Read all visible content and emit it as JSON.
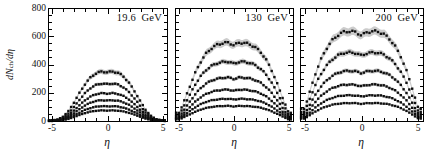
{
  "figure": {
    "xlabel": "η",
    "ylabel_parts": {
      "d1": "d",
      "N": "N",
      "sub": "ch",
      "d2": "/d",
      "eta": "η"
    }
  },
  "chart_data": {
    "type": "scatter",
    "xlabel": "η",
    "ylabel": "dN_ch/dη",
    "xlim": [
      -5.4,
      5.4
    ],
    "ylim": [
      0,
      800
    ],
    "xticks": [
      -5,
      0,
      5
    ],
    "x_minor_step": 1,
    "yticks": [
      0,
      200,
      400,
      600,
      800
    ],
    "y_minor_step": 50,
    "grid": false,
    "legend": "none",
    "marker": "filled-square",
    "marker_color": "#0f0f0f",
    "band_color": "#cccccc",
    "abs_eta": [
      0,
      0.5,
      1,
      1.5,
      2,
      2.5,
      3,
      3.5,
      4,
      4.5,
      5
    ],
    "panels": [
      {
        "title": "19.6  GeV",
        "series": [
          {
            "values": [
              345,
              350,
              340,
              312,
              266,
              205,
              137,
              74,
              32,
              11,
              4
            ]
          },
          {
            "values": [
              261,
              265,
              257,
              236,
              201,
              155,
              103,
              56,
              24,
              8,
              3
            ]
          },
          {
            "values": [
              194,
              197,
              191,
              175,
              150,
              115,
              77,
              41,
              18,
              6,
              2
            ]
          },
          {
            "values": [
              145,
              147,
              143,
              131,
              112,
              86,
              57,
              31,
              13,
              4,
              2
            ]
          },
          {
            "values": [
              103,
              105,
              102,
              93,
              80,
              61,
              41,
              22,
              9,
              3,
              1
            ]
          },
          {
            "values": [
              74,
              75,
              73,
              67,
              57,
              44,
              29,
              16,
              7,
              2,
              1
            ]
          }
        ]
      },
      {
        "title": "130  GeV",
        "series": [
          {
            "values": [
              536,
              555,
              552,
              541,
              519,
              483,
              427,
              350,
              255,
              155,
              58
            ]
          },
          {
            "values": [
              405,
              420,
              418,
              410,
              393,
              365,
              323,
              265,
              193,
              118,
              44
            ]
          },
          {
            "values": [
              297,
              308,
              306,
              300,
              288,
              268,
              237,
              194,
              142,
              86,
              32
            ]
          },
          {
            "values": [
              214,
              222,
              221,
              216,
              208,
              193,
              171,
              140,
              102,
              62,
              23
            ]
          },
          {
            "values": [
              152,
              157,
              156,
              153,
              147,
              137,
              121,
              99,
              72,
              44,
              16
            ]
          },
          {
            "values": [
              103,
              107,
              106,
              104,
              100,
              93,
              82,
              67,
              49,
              30,
              11
            ]
          }
        ]
      },
      {
        "title": "200  GeV",
        "series": [
          {
            "values": [
              606,
              629,
              635,
              632,
              613,
              578,
              524,
              448,
              346,
              219,
              86
            ]
          },
          {
            "values": [
              463,
              480,
              485,
              483,
              468,
              441,
              400,
              342,
              264,
              167,
              65
            ]
          },
          {
            "values": [
              339,
              351,
              355,
              353,
              343,
              323,
              293,
              250,
              193,
              122,
              48
            ]
          },
          {
            "values": [
              246,
              255,
              258,
              257,
              249,
              235,
              213,
              182,
              141,
              89,
              35
            ]
          },
          {
            "values": [
              174,
              180,
              182,
              181,
              176,
              166,
              150,
              128,
              99,
              63,
              25
            ]
          },
          {
            "values": [
              121,
              126,
              127,
              126,
              123,
              116,
              105,
              90,
              69,
              44,
              17
            ]
          }
        ]
      }
    ]
  }
}
